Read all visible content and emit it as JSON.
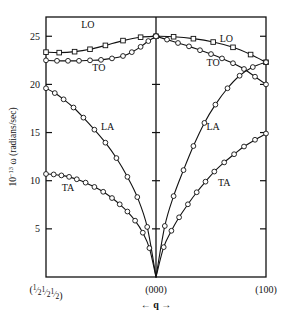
{
  "chart_data": {
    "type": "line",
    "title": "",
    "subtitle": "",
    "xlabel": "← q →",
    "ylabel": "10⁻¹³ ω (radians/sec)",
    "ylabel_parts": {
      "prefix": "10",
      "exponent": "−13",
      "omega": "ω",
      "units": "(radians/sec)"
    },
    "ylim": [
      0,
      27.0
    ],
    "yticks": [
      5,
      10,
      15,
      20,
      25
    ],
    "ytick_labels": [
      "5",
      "10",
      "15",
      "20",
      "25"
    ],
    "xlim": [
      -1,
      1
    ],
    "xtick_labels": [
      "(½½½)",
      "(000)",
      "(100)"
    ],
    "xtick_left_parts": [
      "(",
      "1",
      "2",
      "1",
      "2",
      "1",
      "2",
      ")"
    ],
    "grid": false,
    "legend": "inline-annotations",
    "legend_position": "none",
    "center_line": true,
    "branch_labels": [
      {
        "name": "LO-left",
        "text": "LO",
        "x": -0.62,
        "y": 25.9
      },
      {
        "name": "TO-left",
        "text": "TO",
        "x": -0.52,
        "y": 21.4
      },
      {
        "name": "LA-left",
        "text": "LA",
        "x": -0.44,
        "y": 15.3
      },
      {
        "name": "TA-left",
        "text": "TA",
        "x": -0.8,
        "y": 8.9
      },
      {
        "name": "LO-right",
        "text": "LO",
        "x": 0.64,
        "y": 24.4
      },
      {
        "name": "TO-right",
        "text": "TO",
        "x": 0.52,
        "y": 21.9
      },
      {
        "name": "LA-right",
        "text": "LA",
        "x": 0.52,
        "y": 15.3
      },
      {
        "name": "TA-right",
        "text": "TA",
        "x": 0.62,
        "y": 9.5
      }
    ],
    "series": [
      {
        "name": "LO",
        "marker": "square",
        "branch": "longitudinal-optical",
        "points": [
          {
            "x": -1.0,
            "y": 23.35
          },
          {
            "x": -0.88,
            "y": 23.3
          },
          {
            "x": -0.74,
            "y": 23.4
          },
          {
            "x": -0.6,
            "y": 23.65
          },
          {
            "x": -0.46,
            "y": 24.05
          },
          {
            "x": -0.3,
            "y": 24.55
          },
          {
            "x": -0.14,
            "y": 24.9
          },
          {
            "x": 0.0,
            "y": 25.0
          },
          {
            "x": 0.16,
            "y": 24.95
          },
          {
            "x": 0.34,
            "y": 24.75
          },
          {
            "x": 0.52,
            "y": 24.4
          },
          {
            "x": 0.7,
            "y": 23.85
          },
          {
            "x": 0.86,
            "y": 23.1
          },
          {
            "x": 1.0,
            "y": 22.3
          }
        ]
      },
      {
        "name": "TO",
        "marker": "circle",
        "branch": "transverse-optical",
        "points": [
          {
            "x": -1.0,
            "y": 22.5
          },
          {
            "x": -0.9,
            "y": 22.45
          },
          {
            "x": -0.8,
            "y": 22.45
          },
          {
            "x": -0.7,
            "y": 22.45
          },
          {
            "x": -0.6,
            "y": 22.5
          },
          {
            "x": -0.5,
            "y": 22.55
          },
          {
            "x": -0.4,
            "y": 22.7
          },
          {
            "x": -0.3,
            "y": 22.95
          },
          {
            "x": -0.22,
            "y": 23.35
          },
          {
            "x": -0.14,
            "y": 23.9
          },
          {
            "x": -0.07,
            "y": 24.5
          },
          {
            "x": 0.0,
            "y": 25.0
          },
          {
            "x": 0.1,
            "y": 24.65
          },
          {
            "x": 0.2,
            "y": 24.3
          },
          {
            "x": 0.3,
            "y": 23.95
          },
          {
            "x": 0.4,
            "y": 23.55
          },
          {
            "x": 0.5,
            "y": 23.15
          },
          {
            "x": 0.6,
            "y": 22.7
          },
          {
            "x": 0.7,
            "y": 22.2
          },
          {
            "x": 0.8,
            "y": 21.6
          },
          {
            "x": 0.9,
            "y": 20.8
          },
          {
            "x": 1.0,
            "y": 20.0
          }
        ]
      },
      {
        "name": "LA",
        "marker": "circle",
        "branch": "longitudinal-acoustic",
        "points": [
          {
            "x": -1.0,
            "y": 19.6
          },
          {
            "x": -0.92,
            "y": 19.1
          },
          {
            "x": -0.84,
            "y": 18.45
          },
          {
            "x": -0.75,
            "y": 17.6
          },
          {
            "x": -0.66,
            "y": 16.55
          },
          {
            "x": -0.56,
            "y": 15.3
          },
          {
            "x": -0.46,
            "y": 13.95
          },
          {
            "x": -0.36,
            "y": 12.35
          },
          {
            "x": -0.26,
            "y": 10.4
          },
          {
            "x": -0.17,
            "y": 8.3
          },
          {
            "x": -0.08,
            "y": 5.2
          },
          {
            "x": 0.0,
            "y": 0.0
          },
          {
            "x": 0.08,
            "y": 5.3
          },
          {
            "x": 0.16,
            "y": 8.4
          },
          {
            "x": 0.25,
            "y": 11.1
          },
          {
            "x": 0.34,
            "y": 13.6
          },
          {
            "x": 0.44,
            "y": 16.0
          },
          {
            "x": 0.54,
            "y": 17.9
          },
          {
            "x": 0.65,
            "y": 19.6
          },
          {
            "x": 0.76,
            "y": 20.9
          },
          {
            "x": 0.88,
            "y": 21.8
          },
          {
            "x": 1.0,
            "y": 22.3
          }
        ]
      },
      {
        "name": "TA",
        "marker": "circle",
        "branch": "transverse-acoustic",
        "points": [
          {
            "x": -1.0,
            "y": 10.7
          },
          {
            "x": -0.93,
            "y": 10.65
          },
          {
            "x": -0.86,
            "y": 10.55
          },
          {
            "x": -0.79,
            "y": 10.4
          },
          {
            "x": -0.72,
            "y": 10.15
          },
          {
            "x": -0.64,
            "y": 9.8
          },
          {
            "x": -0.56,
            "y": 9.35
          },
          {
            "x": -0.48,
            "y": 8.85
          },
          {
            "x": -0.4,
            "y": 8.2
          },
          {
            "x": -0.33,
            "y": 7.55
          },
          {
            "x": -0.26,
            "y": 6.8
          },
          {
            "x": -0.19,
            "y": 5.85
          },
          {
            "x": -0.12,
            "y": 4.6
          },
          {
            "x": -0.06,
            "y": 3.0
          },
          {
            "x": 0.0,
            "y": 0.0
          },
          {
            "x": 0.07,
            "y": 3.1
          },
          {
            "x": 0.14,
            "y": 4.8
          },
          {
            "x": 0.21,
            "y": 6.2
          },
          {
            "x": 0.29,
            "y": 7.55
          },
          {
            "x": 0.37,
            "y": 8.8
          },
          {
            "x": 0.45,
            "y": 9.9
          },
          {
            "x": 0.53,
            "y": 10.95
          },
          {
            "x": 0.62,
            "y": 11.9
          },
          {
            "x": 0.71,
            "y": 12.75
          },
          {
            "x": 0.8,
            "y": 13.55
          },
          {
            "x": 0.9,
            "y": 14.25
          },
          {
            "x": 1.0,
            "y": 14.9
          }
        ]
      }
    ]
  },
  "colors": {
    "line": "#111111",
    "frame": "#111111",
    "background": "#ffffff"
  }
}
